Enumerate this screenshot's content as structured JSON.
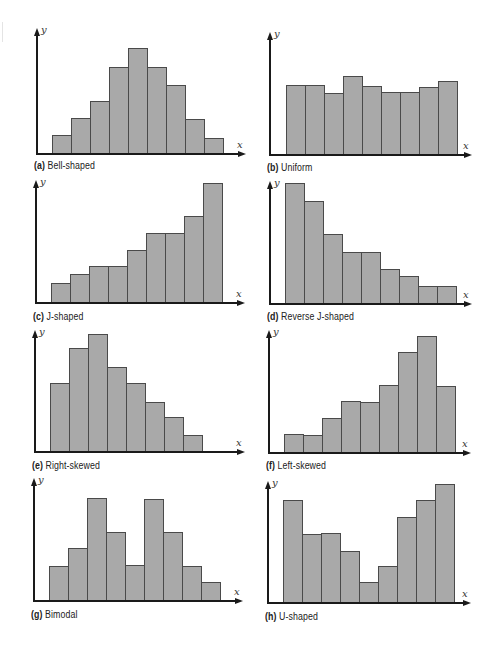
{
  "chart_data": [
    {
      "type": "bar",
      "id": "a",
      "title": "Bell-shaped",
      "caption_letter": "(a)",
      "xlabel": "x",
      "ylabel": "y",
      "categories": [
        "1",
        "2",
        "3",
        "4",
        "5",
        "6",
        "7",
        "8",
        "9"
      ],
      "values": [
        18,
        35,
        52,
        86,
        105,
        86,
        68,
        34,
        15
      ],
      "layout": {
        "axis_x": 36,
        "baseline": 153,
        "axis_top": 28,
        "axis_right": 246,
        "bar_start": 52,
        "bar_width": 19,
        "caption_y": 160
      }
    },
    {
      "type": "bar",
      "id": "b",
      "title": "Uniform",
      "caption_letter": "(b)",
      "xlabel": "x",
      "ylabel": "y",
      "categories": [
        "1",
        "2",
        "3",
        "4",
        "5",
        "6",
        "7",
        "8",
        "9"
      ],
      "values": [
        69,
        69,
        61,
        78,
        68,
        62,
        62,
        67,
        73
      ],
      "layout": {
        "axis_x": 269,
        "baseline": 154,
        "axis_top": 32,
        "axis_right": 472,
        "bar_start": 286,
        "bar_width": 19,
        "caption_y": 162
      }
    },
    {
      "type": "bar",
      "id": "c",
      "title": "J-shaped",
      "caption_letter": "(c)",
      "xlabel": "x",
      "ylabel": "y",
      "categories": [
        "1",
        "2",
        "3",
        "4",
        "5",
        "6",
        "7",
        "8",
        "9"
      ],
      "values": [
        19,
        28,
        36,
        36,
        52,
        69,
        69,
        86,
        119
      ],
      "layout": {
        "axis_x": 35,
        "baseline": 302,
        "axis_top": 180,
        "axis_right": 245,
        "bar_start": 51,
        "bar_width": 19,
        "caption_y": 311
      }
    },
    {
      "type": "bar",
      "id": "d",
      "title": "Reverse J-shaped",
      "caption_letter": "(d)",
      "xlabel": "x",
      "ylabel": "y",
      "categories": [
        "1",
        "2",
        "3",
        "4",
        "5",
        "6",
        "7",
        "8",
        "9"
      ],
      "values": [
        120,
        102,
        69,
        51,
        51,
        34,
        27,
        17,
        17
      ],
      "layout": {
        "axis_x": 269,
        "baseline": 303,
        "axis_top": 181,
        "axis_right": 472,
        "bar_start": 285,
        "bar_width": 19,
        "caption_y": 311
      }
    },
    {
      "type": "bar",
      "id": "e",
      "title": "Right-skewed",
      "caption_letter": "(e)",
      "xlabel": "x",
      "ylabel": "y",
      "categories": [
        "1",
        "2",
        "3",
        "4",
        "5",
        "6",
        "7",
        "8"
      ],
      "values": [
        68,
        103,
        117,
        84,
        68,
        49,
        34,
        16
      ],
      "layout": {
        "axis_x": 34,
        "baseline": 451,
        "axis_top": 330,
        "axis_right": 245,
        "bar_start": 50,
        "bar_width": 19,
        "caption_y": 460
      }
    },
    {
      "type": "bar",
      "id": "f",
      "title": "Left-skewed",
      "caption_letter": "(f)",
      "xlabel": "x",
      "ylabel": "y",
      "categories": [
        "1",
        "2",
        "3",
        "4",
        "5",
        "6",
        "7",
        "8",
        "9"
      ],
      "values": [
        18,
        17,
        34,
        51,
        50,
        67,
        100,
        116,
        66
      ],
      "layout": {
        "axis_x": 268,
        "baseline": 452,
        "axis_top": 330,
        "axis_right": 471,
        "bar_start": 284,
        "bar_width": 19,
        "caption_y": 460
      }
    },
    {
      "type": "bar",
      "id": "g",
      "title": "Bimodal",
      "caption_letter": "(g)",
      "xlabel": "x",
      "ylabel": "y",
      "categories": [
        "1",
        "2",
        "3",
        "4",
        "5",
        "6",
        "7",
        "8",
        "9"
      ],
      "values": [
        34,
        52,
        102,
        68,
        35,
        101,
        68,
        34,
        18
      ],
      "layout": {
        "axis_x": 33,
        "baseline": 600,
        "axis_top": 478,
        "axis_right": 243,
        "bar_start": 49,
        "bar_width": 19,
        "caption_y": 609
      }
    },
    {
      "type": "bar",
      "id": "h",
      "title": "U-shaped",
      "caption_letter": "(h)",
      "xlabel": "x",
      "ylabel": "y",
      "categories": [
        "1",
        "2",
        "3",
        "4",
        "5",
        "6",
        "7",
        "8",
        "9"
      ],
      "values": [
        102,
        68,
        69,
        51,
        20,
        36,
        85,
        102,
        118
      ],
      "layout": {
        "axis_x": 267,
        "baseline": 602,
        "axis_top": 481,
        "axis_right": 471,
        "bar_start": 283,
        "bar_width": 19,
        "caption_y": 611
      }
    }
  ],
  "colors": {
    "bar_fill": "#a9a9a9",
    "bar_outline": "#4a4a4a",
    "axis": "#1a1a1a"
  }
}
